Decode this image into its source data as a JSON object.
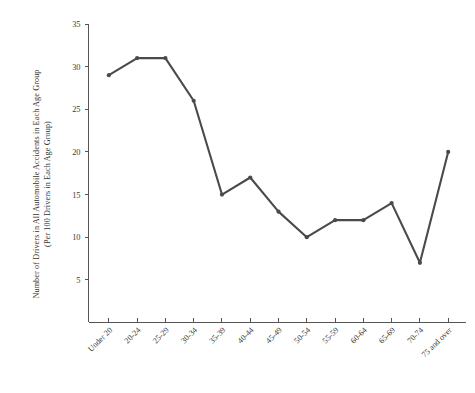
{
  "chart_data": {
    "type": "line",
    "title": "",
    "xlabel": "",
    "ylabel_lines": [
      "Number of Drivers in All Automobile Accidents in Each Age Group",
      "(Per 100 Drivers in Each Age Group)"
    ],
    "ylabel": "Number of Drivers in All Automobile Accidents in Each Age Group (Per 100 Drivers in Each Age Group)",
    "categories": [
      "Under 20",
      "20-24",
      "25-29",
      "30-34",
      "35-39",
      "40-44",
      "45-49",
      "50-54",
      "55-59",
      "60-64",
      "65-69",
      "70-74",
      "75 and over"
    ],
    "values": [
      29,
      31,
      31,
      26,
      15,
      17,
      13,
      10,
      12,
      12,
      14,
      7,
      20
    ],
    "series": [
      {
        "name": "Drivers in accidents per 100 drivers",
        "values": [
          29,
          31,
          31,
          26,
          15,
          17,
          13,
          10,
          12,
          12,
          14,
          7,
          20
        ]
      }
    ],
    "ylim": [
      0,
      35
    ],
    "ytick_values": [
      5,
      10,
      15,
      20,
      25,
      30,
      35
    ],
    "ytick_labels": [
      "5",
      "10",
      "15",
      "20",
      "25",
      "30",
      "35"
    ],
    "grid": false,
    "legend": false,
    "legend_position": "none",
    "line_color": "#4a4a4a",
    "marker_color": "#4a4a4a",
    "axis_color": "#555555",
    "background_color": "#ffffff",
    "marker": "circle",
    "xtick_rotation_degrees": 45
  }
}
